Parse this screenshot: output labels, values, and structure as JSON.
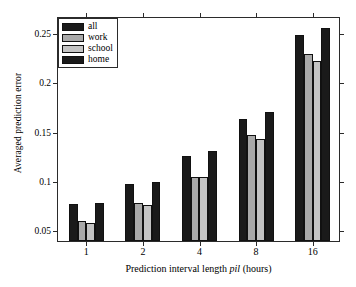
{
  "chart_data": {
    "type": "bar",
    "title": "",
    "xlabel": "Prediction interval length pil (hours)",
    "xlabel_plain": "Prediction interval length ",
    "xlabel_italic": "pil",
    "xlabel_tail": " (hours)",
    "ylabel": "Averaged prediction error",
    "categories": [
      "1",
      "2",
      "4",
      "8",
      "16"
    ],
    "xticklabels": [
      "1",
      "2",
      "4",
      "8",
      "16"
    ],
    "yticklabels": [
      "0.05",
      "0.1",
      "0.15",
      "0.2",
      "0.25"
    ],
    "ytickvalues": [
      0.05,
      0.1,
      0.15,
      0.2,
      0.25
    ],
    "ylim": [
      0.04,
      0.2665
    ],
    "grid": false,
    "legend_position": "upper-left",
    "series": [
      {
        "name": "all",
        "color": "#1a1a1a",
        "values": [
          0.078,
          0.098,
          0.126,
          0.164,
          0.249
        ]
      },
      {
        "name": "work",
        "color": "#a9a9a9",
        "values": [
          0.06,
          0.079,
          0.105,
          0.148,
          0.23
        ]
      },
      {
        "name": "school",
        "color": "#c4c4c4",
        "values": [
          0.058,
          0.077,
          0.105,
          0.144,
          0.223
        ]
      },
      {
        "name": "home",
        "color": "#1a1a1a",
        "values": [
          0.079,
          0.1,
          0.131,
          0.171,
          0.256
        ]
      }
    ]
  },
  "legend": {
    "items": [
      {
        "label": "all",
        "color": "#1a1a1a"
      },
      {
        "label": "work",
        "color": "#a9a9a9"
      },
      {
        "label": "school",
        "color": "#c4c4c4"
      },
      {
        "label": "home",
        "color": "#1a1a1a"
      }
    ]
  }
}
